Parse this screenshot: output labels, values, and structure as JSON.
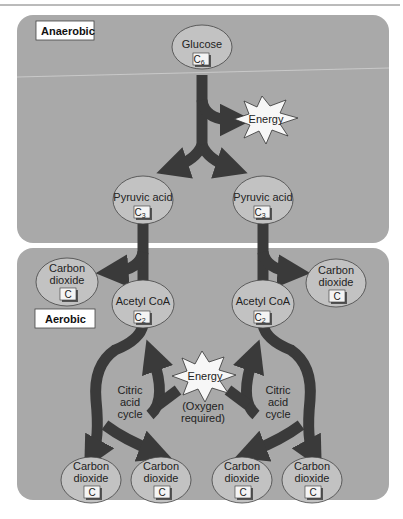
{
  "sections": {
    "anaerobic": {
      "label": "Anaerobic"
    },
    "aerobic": {
      "label": "Aerobic"
    }
  },
  "nodes": {
    "glucose": {
      "name": "Glucose",
      "carbon": "C",
      "sub": "6"
    },
    "pyruvic_left": {
      "name": "Pyruvic acid",
      "carbon": "C",
      "sub": "3"
    },
    "pyruvic_right": {
      "name": "Pyruvic acid",
      "carbon": "C",
      "sub": "3"
    },
    "co2_top_left": {
      "line1": "Carbon",
      "line2": "dioxide",
      "carbon": "C"
    },
    "co2_top_right": {
      "line1": "Carbon",
      "line2": "dioxide",
      "carbon": "C"
    },
    "acetyl_left": {
      "name": "Acetyl CoA",
      "carbon": "C",
      "sub": "2"
    },
    "acetyl_right": {
      "name": "Acetyl CoA",
      "carbon": "C",
      "sub": "2"
    },
    "co2_bottom": [
      {
        "line1": "Carbon",
        "line2": "dioxide",
        "carbon": "C"
      },
      {
        "line1": "Carbon",
        "line2": "dioxide",
        "carbon": "C"
      },
      {
        "line1": "Carbon",
        "line2": "dioxide",
        "carbon": "C"
      },
      {
        "line1": "Carbon",
        "line2": "dioxide",
        "carbon": "C"
      }
    ]
  },
  "energy_top": {
    "label": "Energy"
  },
  "energy_middle": {
    "label": "Energy",
    "note_line1": "(Oxygen",
    "note_line2": "required)"
  },
  "cycles": {
    "left": {
      "line1": "Citric",
      "line2": "acid",
      "line3": "cycle"
    },
    "right": {
      "line1": "Citric",
      "line2": "acid",
      "line3": "cycle"
    }
  },
  "colors": {
    "panel": "#a9a9a9",
    "ellipse": "#c2c2c2",
    "arrow": "#3a3a3a",
    "star": "#f7f7f7"
  }
}
